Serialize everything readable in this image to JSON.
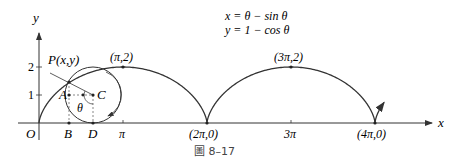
{
  "figure": {
    "caption": "圖 8–17",
    "equations": [
      "x = θ − sin θ",
      "y = 1 − cos θ"
    ],
    "axes": {
      "x_label": "x",
      "y_label": "y",
      "origin_label": "O",
      "y_ticks": [
        "1",
        "2"
      ],
      "x_ticks": [
        "π",
        "3π"
      ]
    },
    "points": {
      "P": "P(x,y)",
      "A": "A",
      "B": "B",
      "C": "C",
      "D": "D",
      "theta": "θ",
      "peak1": "(π,2)",
      "peak2": "(3π,2)",
      "cusp1": "(2π,0)",
      "cusp2": "(4π,0)"
    }
  },
  "chart_data": {
    "type": "line",
    "xlabel": "x",
    "ylabel": "y",
    "xlim": [
      0,
      4.6
    ],
    "ylim": [
      0,
      2
    ],
    "x_ticks": [
      "π",
      "2π",
      "3π",
      "4π"
    ],
    "y_ticks": [
      1,
      2
    ],
    "labeled_points": [
      {
        "label": "(π,2)",
        "x": 3.1416,
        "y": 2
      },
      {
        "label": "(3π,2)",
        "x": 9.4248,
        "y": 2
      },
      {
        "label": "(2π,0)",
        "x": 6.2832,
        "y": 0
      },
      {
        "label": "(4π,0)",
        "x": 12.5664,
        "y": 0
      }
    ],
    "rolling_circle": {
      "radius": 1,
      "center_label": "C",
      "tangent_point": "D"
    }
  }
}
